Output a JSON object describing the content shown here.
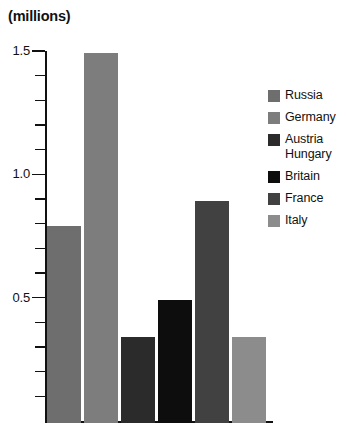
{
  "chart_data": {
    "type": "bar",
    "title": "(millions)",
    "xlabel": "",
    "ylabel": "",
    "unit": "millions",
    "categories": [
      "Russia",
      "Germany",
      "Austria Hungary",
      "Britain",
      "France",
      "Italy"
    ],
    "values": [
      0.8,
      1.5,
      0.35,
      0.5,
      0.9,
      0.35
    ],
    "series": [
      {
        "name": "Troops",
        "values": [
          0.8,
          1.5,
          0.35,
          0.5,
          0.9,
          0.35
        ]
      }
    ],
    "colors": [
      "#6e6e6e",
      "#7d7d7d",
      "#2b2b2b",
      "#0d0d0d",
      "#414141",
      "#8c8c8c"
    ],
    "ylim": [
      0,
      1.55
    ],
    "ytick_labels": [
      "1.5",
      "1.0",
      "0.5"
    ],
    "ytick_values": [
      1.5,
      1.0,
      0.5
    ],
    "minor_tick_step": 0.1,
    "grid": false,
    "legend_position": "right",
    "legend_entries": [
      {
        "label": "Russia",
        "color": "#6e6e6e"
      },
      {
        "label": "Germany",
        "color": "#7d7d7d"
      },
      {
        "label": "Austria\nHungary",
        "color": "#2b2b2b"
      },
      {
        "label": "Britain",
        "color": "#0d0d0d"
      },
      {
        "label": "France",
        "color": "#414141"
      },
      {
        "label": "Italy",
        "color": "#8c8c8c"
      }
    ]
  }
}
